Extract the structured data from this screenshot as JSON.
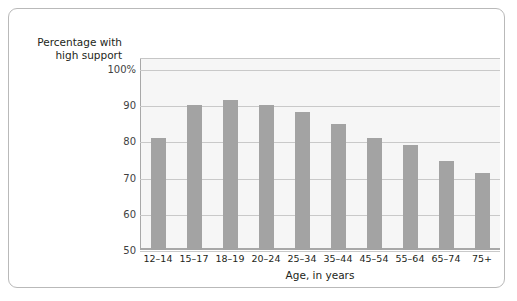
{
  "figure": {
    "frame_border_color": "#b9b9b9",
    "background_color": "#ffffff"
  },
  "chart_data": {
    "type": "bar",
    "title": "",
    "subtitle": "",
    "categories": [
      "12–14",
      "15–17",
      "18–19",
      "20–24",
      "25–34",
      "35–44",
      "45–54",
      "55–64",
      "65–74",
      "75+"
    ],
    "values": [
      81,
      90,
      91.5,
      90,
      88,
      84.8,
      80.8,
      79,
      74.7,
      71.2
    ],
    "series": [
      {
        "name": "Percentage with high support",
        "values": [
          81,
          90,
          91.5,
          90,
          88,
          84.8,
          80.8,
          79,
          74.7,
          71.2
        ]
      }
    ],
    "xlabel": "Age, in years",
    "ylabel": "Percentage with high support",
    "ylabel_lines": [
      "Percentage with",
      "high support"
    ],
    "ylim": [
      50,
      103
    ],
    "yticks": [
      50,
      60,
      70,
      80,
      90,
      100
    ],
    "ytick_labels": [
      "50",
      "60",
      "70",
      "80",
      "90",
      "100%"
    ],
    "grid": true,
    "grid_axis": "y",
    "legend": false,
    "legend_position": "none",
    "bar_color": "#a3a3a3",
    "plot_background_color": "#f6f6f6",
    "gridline_color": "#c9c9c9",
    "axis_color": "#a8a8a8"
  }
}
